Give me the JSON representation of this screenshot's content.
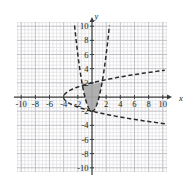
{
  "figure": {
    "title": "",
    "corner_artifact": "",
    "axis_labels": {
      "x": "x",
      "y": "y"
    },
    "x_ticks": [
      "-10",
      "-8",
      "-6",
      "-4",
      "-2",
      "2",
      "4",
      "6",
      "8",
      "10"
    ],
    "y_ticks": [
      "10",
      "8",
      "6",
      "4",
      "2",
      "-2",
      "-4",
      "-6",
      "-8",
      "-10"
    ],
    "colors": {
      "grid_minor": "#d8d8dc",
      "grid_major": "#b9b9c0",
      "axis": "#3a3a3a",
      "curve": "#2a2a2a",
      "shade_fill": "#a9a9a9",
      "background": "#ffffff"
    }
  },
  "chart_data": {
    "type": "line",
    "title": "",
    "xlabel": "x",
    "ylabel": "y",
    "xlim": [
      -10.6,
      10.6
    ],
    "ylim": [
      -10.6,
      10.6
    ],
    "grid": true,
    "grid_spacing_major": 2,
    "grid_spacing_minor": 0.5,
    "legend": "none",
    "axis_ticks": {
      "x": [
        -10,
        -8,
        -6,
        -4,
        -2,
        2,
        4,
        6,
        8,
        10
      ],
      "y": [
        10,
        8,
        6,
        4,
        2,
        -2,
        -4,
        -6,
        -8,
        -10
      ]
    },
    "series": [
      {
        "name": "upward-parabola",
        "style": "dashed",
        "equation": "y = 2x^2 - 2",
        "vertex": [
          0,
          -2
        ],
        "x_range": [
          -2.45,
          2.45
        ],
        "points": [
          [
            -2.45,
            10.0
          ],
          [
            -2.2,
            7.68
          ],
          [
            -2.0,
            6.0
          ],
          [
            -1.75,
            4.13
          ],
          [
            -1.5,
            2.5
          ],
          [
            -1.25,
            1.13
          ],
          [
            -1.0,
            0.0
          ],
          [
            -0.75,
            -0.88
          ],
          [
            -0.5,
            -1.5
          ],
          [
            -0.25,
            -1.88
          ],
          [
            0,
            -2.0
          ],
          [
            0.25,
            -1.88
          ],
          [
            0.5,
            -1.5
          ],
          [
            0.75,
            -0.88
          ],
          [
            1.0,
            0.0
          ],
          [
            1.25,
            1.13
          ],
          [
            1.5,
            2.5
          ],
          [
            1.75,
            4.13
          ],
          [
            2.0,
            6.0
          ],
          [
            2.2,
            7.68
          ],
          [
            2.45,
            10.0
          ]
        ]
      },
      {
        "name": "rightward-parabola",
        "style": "dashed",
        "equation": "x = y^2 - 4",
        "vertex": [
          -4,
          0
        ],
        "y_range": [
          -3.85,
          3.75
        ],
        "points": [
          [
            10.0,
            3.74
          ],
          [
            8.0,
            3.46
          ],
          [
            6.0,
            3.16
          ],
          [
            4.0,
            2.83
          ],
          [
            2.0,
            2.45
          ],
          [
            0.0,
            2.0
          ],
          [
            -1.0,
            1.73
          ],
          [
            -2.0,
            1.41
          ],
          [
            -3.0,
            1.0
          ],
          [
            -3.75,
            0.5
          ],
          [
            -4.0,
            0.0
          ],
          [
            -3.75,
            -0.5
          ],
          [
            -3.0,
            -1.0
          ],
          [
            -2.0,
            -1.41
          ],
          [
            -1.0,
            -1.73
          ],
          [
            0.0,
            -2.0
          ],
          [
            2.0,
            -2.45
          ],
          [
            4.0,
            -2.83
          ],
          [
            6.0,
            -3.16
          ],
          [
            8.0,
            -3.46
          ],
          [
            10.0,
            -3.74
          ]
        ]
      }
    ],
    "shaded_region": {
      "name": "intersection-region",
      "fill": "#a9a9a9",
      "description": "region bounded above by x = y^2 - 4 and below/sides by y = 2x^2 - 2",
      "vertices": [
        [
          -1.35,
          2.0
        ],
        [
          -1.0,
          1.73
        ],
        [
          -0.5,
          1.32
        ],
        [
          0,
          1.0
        ],
        [
          0.5,
          0.35
        ],
        [
          1.0,
          -0.55
        ],
        [
          1.2,
          -1.0
        ],
        [
          1.35,
          -1.55
        ],
        [
          1.42,
          -2.0
        ],
        [
          1.0,
          -2.0
        ],
        [
          0.5,
          -2.0
        ],
        [
          0,
          -2.0
        ],
        [
          -0.5,
          -1.5
        ],
        [
          -0.85,
          -0.6
        ],
        [
          -1.1,
          0.4
        ],
        [
          -1.3,
          1.4
        ]
      ]
    }
  }
}
